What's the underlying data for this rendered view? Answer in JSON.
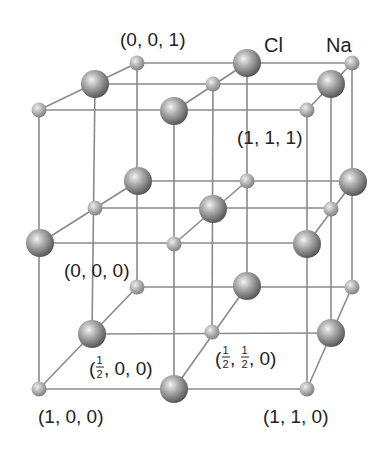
{
  "diagram": {
    "colors": {
      "line": "#8a8a8a",
      "atom_dark": "#5a5a5a",
      "atom_mid": "#9a9a9a",
      "atom_light": "#f2f2f2",
      "text": "#222222"
    },
    "species_labels": {
      "cl": "Cl",
      "na": "Na"
    },
    "coordinate_labels": {
      "p001": "(0, 0, 1)",
      "p111": "(1, 1, 1)",
      "p000": "(0, 0, 0)",
      "p100": "(1, 0, 0)",
      "p110": "(1, 1, 0)",
      "phalf00_prefix": "(",
      "phalf00_suffix": ", 0, 0)",
      "phalfhalf0_prefix": "(",
      "phalfhalf0_mid": ",",
      "phalfhalf0_suffix": ", 0)",
      "frac_num": "1",
      "frac_den": "2"
    },
    "atoms": [
      {
        "species": "Na",
        "x": 137,
        "y": 63
      },
      {
        "species": "Cl",
        "x": 247,
        "y": 63
      },
      {
        "species": "Na",
        "x": 352,
        "y": 63
      },
      {
        "species": "Cl",
        "x": 95,
        "y": 84
      },
      {
        "species": "Na",
        "x": 213,
        "y": 84
      },
      {
        "species": "Cl",
        "x": 331,
        "y": 84
      },
      {
        "species": "Na",
        "x": 39,
        "y": 110
      },
      {
        "species": "Cl",
        "x": 174,
        "y": 111
      },
      {
        "species": "Na",
        "x": 307,
        "y": 110
      },
      {
        "species": "Cl",
        "x": 138,
        "y": 181
      },
      {
        "species": "Na",
        "x": 247,
        "y": 181
      },
      {
        "species": "Cl",
        "x": 353,
        "y": 182
      },
      {
        "species": "Na",
        "x": 95,
        "y": 208
      },
      {
        "species": "Cl",
        "x": 213,
        "y": 209
      },
      {
        "species": "Na",
        "x": 331,
        "y": 209
      },
      {
        "species": "Cl",
        "x": 40,
        "y": 243
      },
      {
        "species": "Na",
        "x": 174,
        "y": 244
      },
      {
        "species": "Cl",
        "x": 307,
        "y": 244
      },
      {
        "species": "Na",
        "x": 137,
        "y": 287
      },
      {
        "species": "Cl",
        "x": 247,
        "y": 286
      },
      {
        "species": "Na",
        "x": 352,
        "y": 287
      },
      {
        "species": "Cl",
        "x": 92,
        "y": 334
      },
      {
        "species": "Na",
        "x": 212,
        "y": 332
      },
      {
        "species": "Cl",
        "x": 331,
        "y": 333
      },
      {
        "species": "Na",
        "x": 39,
        "y": 389
      },
      {
        "species": "Cl",
        "x": 174,
        "y": 389
      },
      {
        "species": "Na",
        "x": 307,
        "y": 389
      }
    ]
  }
}
